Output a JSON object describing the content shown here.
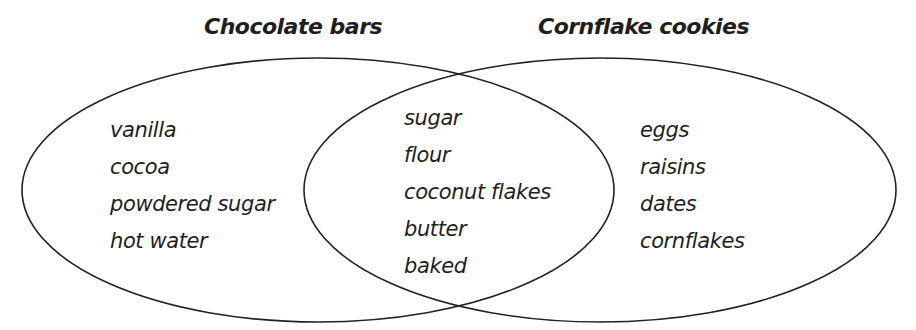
{
  "diagram": {
    "type": "venn",
    "sets": [
      {
        "label": "Chocolate bars",
        "only_items": [
          "vanilla",
          "cocoa",
          "powdered sugar",
          "hot water"
        ]
      },
      {
        "label": "Cornflake cookies",
        "only_items": [
          "eggs",
          "raisins",
          "dates",
          "cornflakes"
        ]
      }
    ],
    "intersection": [
      "sugar",
      "flour",
      "coconut flakes",
      "butter",
      "baked"
    ],
    "stroke_color": "#222222"
  }
}
